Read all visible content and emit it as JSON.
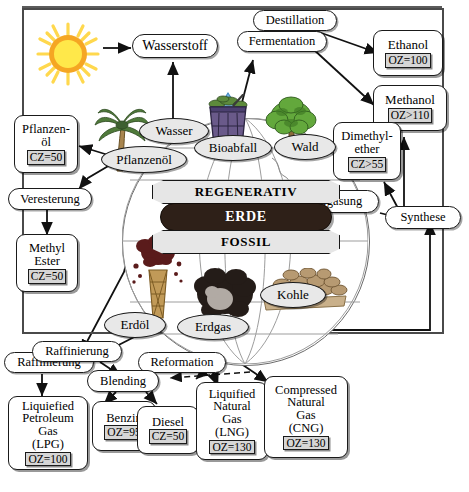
{
  "diagram": {
    "language": "de",
    "frame_color": "#4a4a4a"
  },
  "banners": [
    {
      "id": "regenerativ",
      "label": "REGENERATIV",
      "style": "light-ribbon",
      "color": "#e6e6e6"
    },
    {
      "id": "erde",
      "label": "ERDE",
      "style": "dark-pill",
      "color": "#2e2018"
    },
    {
      "id": "fossil",
      "label": "FOSSIL",
      "style": "light-ribbon",
      "color": "#e6e6e6"
    }
  ],
  "sources": [
    {
      "id": "pflanzenoel",
      "label": "Pflanzenöl",
      "shape": "ellipse"
    },
    {
      "id": "wasser",
      "label": "Wasser",
      "shape": "ellipse"
    },
    {
      "id": "bioabfall",
      "label": "Bioabfall",
      "shape": "ellipse"
    },
    {
      "id": "wald",
      "label": "Wald",
      "shape": "ellipse"
    },
    {
      "id": "erdoel",
      "label": "Erdöl",
      "shape": "ellipse"
    },
    {
      "id": "erdgas",
      "label": "Erdgas",
      "shape": "ellipse"
    },
    {
      "id": "kohle",
      "label": "Kohle",
      "shape": "ellipse"
    }
  ],
  "processes": [
    {
      "id": "destillation",
      "label": "Destillation"
    },
    {
      "id": "fermentation",
      "label": "Fermentation"
    },
    {
      "id": "veresterung",
      "label": "Veresterung"
    },
    {
      "id": "vergasung",
      "label": "Vergasung"
    },
    {
      "id": "synthese",
      "label": "Synthese"
    },
    {
      "id": "raffinierung_a",
      "label": "Raffinierung"
    },
    {
      "id": "raffinierung_b",
      "label": "Raffinierung"
    },
    {
      "id": "reformation",
      "label": "Reformation"
    },
    {
      "id": "blending",
      "label": "Blending"
    }
  ],
  "fuels": [
    {
      "id": "wasserstoff",
      "lines": [
        "Wasserstoff"
      ],
      "value": null
    },
    {
      "id": "ethanol",
      "lines": [
        "Ethanol"
      ],
      "value": "OZ=100"
    },
    {
      "id": "methanol",
      "lines": [
        "Methanol"
      ],
      "value": "OZ>110"
    },
    {
      "id": "dimethylether",
      "lines": [
        "Dimethyl-",
        "ether"
      ],
      "value": "CZ>55"
    },
    {
      "id": "pflanzenoel_box",
      "lines": [
        "Pflanzen-",
        "öl"
      ],
      "value": "CZ=50"
    },
    {
      "id": "methylester",
      "lines": [
        "Methyl",
        "Ester"
      ],
      "value": "CZ=50"
    },
    {
      "id": "lpg",
      "lines": [
        "Liquiefied",
        "Petroleum",
        "Gas",
        "(LPG)"
      ],
      "value": "OZ=100"
    },
    {
      "id": "benzin",
      "lines": [
        "Benzin"
      ],
      "value": "OZ=95"
    },
    {
      "id": "diesel",
      "lines": [
        "Diesel"
      ],
      "value": "CZ=50"
    },
    {
      "id": "lng",
      "lines": [
        "Liquified",
        "Natural",
        "Gas",
        "(LNG)"
      ],
      "value": "OZ=130"
    },
    {
      "id": "cng",
      "lines": [
        "Compressed",
        "Natural",
        "Gas",
        "(CNG)"
      ],
      "value": "OZ=130"
    }
  ],
  "labels": {
    "wasserstoff": "Wasserstoff",
    "destillation": "Destillation",
    "fermentation": "Fermentation",
    "ethanol": "Ethanol",
    "ethanol_value": "OZ=100",
    "methanol": "Methanol",
    "methanol_value": "OZ>110",
    "dme_l1": "Dimethyl-",
    "dme_l2": "ether",
    "dme_value": "CZ>55",
    "pflanzenoel_box_l1": "Pflanzen-",
    "pflanzenoel_box_l2": "öl",
    "pflanzenoel_box_value": "CZ=50",
    "wasser": "Wasser",
    "pflanzenoel": "Pflanzenöl",
    "bioabfall": "Bioabfall",
    "wald": "Wald",
    "veresterung": "Veresterung",
    "methyl": "Methyl",
    "ester": "Ester",
    "methylester_value": "CZ=50",
    "vergasung": "Vergasung",
    "synthese": "Synthese",
    "regenerativ": "REGENERATIV",
    "erde": "ERDE",
    "fossil": "FOSSIL",
    "erdoel": "Erdöl",
    "erdgas": "Erdgas",
    "kohle": "Kohle",
    "raffinierung_a": "Raffinierung",
    "raffinierung_b": "Raffinierung",
    "reformation": "Reformation",
    "blending": "Blending",
    "lpg_l1": "Liquiefied",
    "lpg_l2": "Petroleum",
    "lpg_l3": "Gas",
    "lpg_l4": "(LPG)",
    "lpg_value": "OZ=100",
    "benzin": "Benzin",
    "benzin_value": "OZ=95",
    "diesel": "Diesel",
    "diesel_value": "CZ=50",
    "lng_l1": "Liquified",
    "lng_l2": "Natural",
    "lng_l3": "Gas",
    "lng_l4": "(LNG)",
    "lng_value": "OZ=130",
    "cng_l1": "Compressed",
    "cng_l2": "Natural",
    "cng_l3": "Gas",
    "cng_l4": "(CNG)",
    "cng_value": "OZ=130"
  },
  "pictograms": [
    {
      "id": "sun",
      "name": "sun-icon",
      "colors": {
        "core": "#ffe84a",
        "ring": "#f5a623",
        "ray": "#ffd84d"
      }
    },
    {
      "id": "palm",
      "name": "palm-tree-icon",
      "colors": {
        "leaf": "#4f7a3a",
        "trunk": "#9a7b4a"
      }
    },
    {
      "id": "drop",
      "name": "water-drop-icon",
      "colors": {
        "fill": "#79b8e8"
      }
    },
    {
      "id": "bin",
      "name": "waste-bin-icon",
      "colors": {
        "body": "#6a5a8a",
        "plants": "#5d8a3c"
      }
    },
    {
      "id": "tree",
      "name": "broadleaf-tree-icon",
      "colors": {
        "leaf": "#63a83c",
        "trunk": "#8a6a3a"
      }
    },
    {
      "id": "derrick",
      "name": "oil-derrick-icon",
      "colors": {
        "oil": "#5a1b1b",
        "tower": "#b58b4a"
      }
    },
    {
      "id": "gascloud",
      "name": "gas-cloud-icon",
      "colors": {
        "dark": "#241c18",
        "light": "#b9b2ac"
      }
    },
    {
      "id": "coal",
      "name": "coal-pile-icon",
      "colors": {
        "lump": "#b79a72",
        "ground": "#c9b08a"
      }
    },
    {
      "id": "globe",
      "name": "globe-icon",
      "colors": {
        "line": "#8d8d8d"
      }
    }
  ],
  "colors": {
    "stroke": "#1a1a1a",
    "chip_bg": "#d6d6d6",
    "ellipse_bg": "#e8e8e8",
    "erde_bg": "#2e2018",
    "banner_bg": "#e6e6e6"
  }
}
